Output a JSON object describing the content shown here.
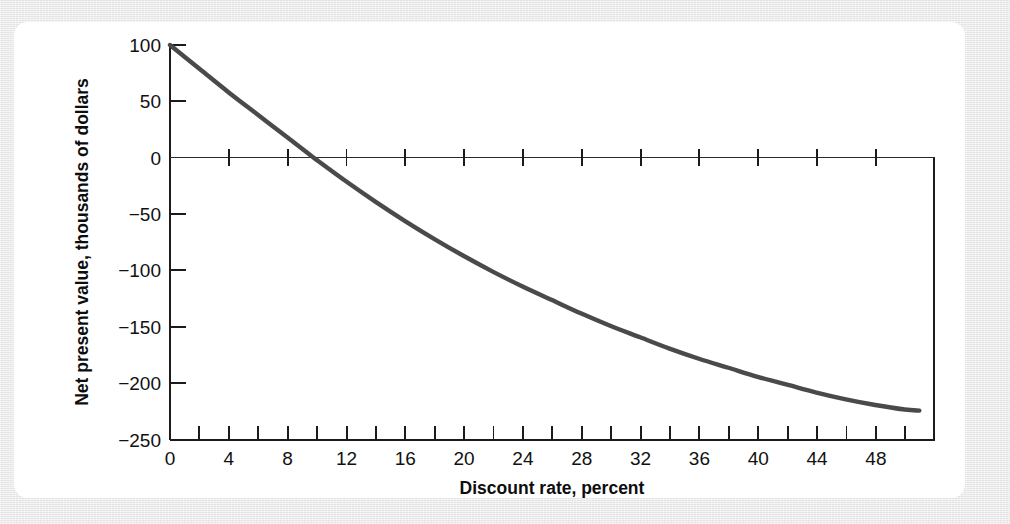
{
  "figure": {
    "background_color": "#e8e8e8",
    "card_color": "#ffffff",
    "curve_color": "#4a4a4a",
    "axis_color": "#1b1b1b"
  },
  "chart_data": {
    "type": "line",
    "title": "",
    "subtitle": "",
    "xlabel": "Discount rate, percent",
    "ylabel": "Net present value, thousands of dollars",
    "xlim": [
      0,
      52
    ],
    "ylim": [
      -250,
      100
    ],
    "grid": false,
    "legend": "none",
    "x_major_ticks": [
      0,
      4,
      8,
      12,
      16,
      20,
      24,
      28,
      32,
      36,
      40,
      44,
      48
    ],
    "x_minor_tick_step": 2,
    "x_tick_labels": [
      "0",
      "4",
      "8",
      "12",
      "16",
      "20",
      "24",
      "28",
      "32",
      "36",
      "40",
      "44",
      "48"
    ],
    "y_major_ticks": [
      100,
      50,
      0,
      -50,
      -100,
      -150,
      -200,
      -250
    ],
    "y_tick_labels": [
      "100",
      "50",
      "0",
      "−50",
      "−100",
      "−150",
      "−200",
      "−250"
    ],
    "zero_line_value": 0,
    "annotations": [],
    "series": [
      {
        "name": "Net present value",
        "color": "#4a4a4a",
        "x": [
          0,
          2,
          4,
          6,
          8,
          9.5,
          10,
          12,
          14,
          16,
          18,
          20,
          22,
          24,
          26,
          28,
          30,
          32,
          34,
          36,
          38,
          40,
          42,
          44,
          46,
          48,
          50,
          51
        ],
        "values": [
          100,
          79,
          58,
          38,
          18,
          3,
          -2,
          -21,
          -39,
          -56,
          -72,
          -87,
          -101,
          -114,
          -126,
          -138,
          -149,
          -159,
          -169,
          -178,
          -186,
          -194,
          -201,
          -208,
          -214,
          -219,
          -223,
          -224
        ]
      }
    ]
  }
}
